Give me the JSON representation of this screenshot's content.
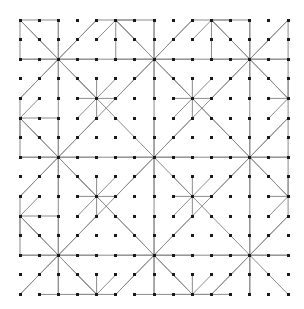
{
  "figure": {
    "type": "diagram",
    "background_color": "#ffffff",
    "canvas": {
      "width": 304,
      "height": 309
    }
  },
  "lattice": {
    "name": "square-dot-lattice",
    "origin_x": 20,
    "origin_y": 20,
    "spacing_x": 19.15,
    "spacing_y": 19.6,
    "cols": 15,
    "rows": 15,
    "dot_color": "#1a1a1a",
    "dot_size": 3
  },
  "edges": {
    "color": "#8c8c8c",
    "width": 1
  },
  "stars": {
    "spoke_directions": [
      [
        1,
        0
      ],
      [
        1,
        1
      ],
      [
        0,
        1
      ],
      [
        -1,
        1
      ],
      [
        -1,
        0
      ],
      [
        -1,
        -1
      ],
      [
        0,
        -1
      ],
      [
        1,
        -1
      ]
    ],
    "hubs": [
      {
        "col": 2,
        "row": 2,
        "arms": [
          2,
          2,
          2,
          2,
          2,
          2,
          2,
          2
        ]
      },
      {
        "col": 7,
        "row": 2,
        "arms": [
          2,
          2,
          2,
          2,
          2,
          2,
          2,
          2
        ]
      },
      {
        "col": 12,
        "row": 2,
        "arms": [
          2,
          2,
          2,
          2,
          2,
          2,
          2,
          2
        ]
      },
      {
        "col": 2,
        "row": 7,
        "arms": [
          2,
          2,
          2,
          2,
          2,
          2,
          2,
          2
        ]
      },
      {
        "col": 7,
        "row": 7,
        "arms": [
          2,
          2,
          2,
          2,
          2,
          2,
          2,
          2
        ]
      },
      {
        "col": 12,
        "row": 7,
        "arms": [
          2,
          2,
          2,
          2,
          2,
          2,
          2,
          2
        ]
      },
      {
        "col": 2,
        "row": 12,
        "arms": [
          2,
          2,
          2,
          2,
          2,
          2,
          2,
          2
        ]
      },
      {
        "col": 7,
        "row": 12,
        "arms": [
          2,
          2,
          2,
          2,
          2,
          2,
          2,
          2
        ]
      },
      {
        "col": 12,
        "row": 12,
        "arms": [
          2,
          2,
          2,
          2,
          2,
          2,
          2,
          2
        ]
      },
      {
        "col": 4,
        "row": 4,
        "arms": [
          1,
          1,
          1,
          1,
          1,
          1,
          1,
          1
        ]
      },
      {
        "col": 9,
        "row": 4,
        "arms": [
          1,
          1,
          1,
          1,
          1,
          1,
          1,
          1
        ]
      },
      {
        "col": 4,
        "row": 9,
        "arms": [
          1,
          1,
          1,
          1,
          1,
          1,
          1,
          1
        ]
      },
      {
        "col": 9,
        "row": 9,
        "arms": [
          1,
          1,
          1,
          1,
          1,
          1,
          1,
          1
        ]
      },
      {
        "col": 14,
        "row": 9,
        "arms": [
          1,
          1,
          1,
          1,
          1,
          1,
          1,
          1
        ]
      },
      {
        "col": 4,
        "row": 14,
        "arms": [
          1,
          1,
          1,
          1,
          1,
          1,
          1,
          1
        ]
      },
      {
        "col": 9,
        "row": 14,
        "arms": [
          1,
          1,
          1,
          1,
          1,
          1,
          1,
          1
        ]
      },
      {
        "col": 14,
        "row": 4,
        "arms": [
          1,
          1,
          1,
          1,
          1,
          1,
          1,
          1
        ]
      },
      {
        "col": 0,
        "row": 5,
        "arms": [
          2,
          1,
          1,
          0,
          0,
          0,
          1,
          1
        ]
      },
      {
        "col": 0,
        "row": 10,
        "arms": [
          2,
          1,
          1,
          0,
          0,
          0,
          1,
          1
        ]
      },
      {
        "col": 5,
        "row": 0,
        "arms": [
          1,
          1,
          2,
          1,
          1,
          0,
          0,
          0
        ]
      },
      {
        "col": 10,
        "row": 0,
        "arms": [
          1,
          1,
          2,
          1,
          1,
          0,
          0,
          0
        ]
      }
    ]
  },
  "diagonals": {
    "color": "#8c8c8c",
    "lines": [
      {
        "c1": 0,
        "r1": 4,
        "c2": 4,
        "r2": 0
      },
      {
        "c1": 0,
        "r1": 9,
        "c2": 9,
        "r2": 0
      },
      {
        "c1": 0,
        "r1": 14,
        "c2": 14,
        "r2": 0
      },
      {
        "c1": 5,
        "r1": 14,
        "c2": 14,
        "r2": 5
      },
      {
        "c1": 10,
        "r1": 14,
        "c2": 14,
        "r2": 10
      },
      {
        "c1": 0,
        "r1": 0,
        "c2": 4,
        "r2": 4
      },
      {
        "c1": 0,
        "r1": 5,
        "c2": 9,
        "r2": 14
      },
      {
        "c1": 5,
        "r1": 0,
        "c2": 14,
        "r2": 9
      },
      {
        "c1": 10,
        "r1": 0,
        "c2": 14,
        "r2": 4
      },
      {
        "c1": 0,
        "r1": 10,
        "c2": 4,
        "r2": 14
      }
    ]
  },
  "straight_runs": {
    "color": "#8c8c8c",
    "horizontal": [
      {
        "row": 0,
        "c1": 0,
        "c2": 2
      },
      {
        "row": 0,
        "c1": 5,
        "c2": 7
      },
      {
        "row": 0,
        "c1": 10,
        "c2": 12
      },
      {
        "row": 2,
        "c1": 0,
        "c2": 14
      },
      {
        "row": 7,
        "c1": 0,
        "c2": 14
      },
      {
        "row": 12,
        "c1": 0,
        "c2": 14
      },
      {
        "row": 14,
        "c1": 1,
        "c2": 4
      },
      {
        "row": 14,
        "c1": 6,
        "c2": 11
      }
    ],
    "vertical": [
      {
        "col": 0,
        "r1": 0,
        "r2": 2
      },
      {
        "col": 0,
        "r1": 5,
        "r2": 7
      },
      {
        "col": 0,
        "r1": 10,
        "r2": 12
      },
      {
        "col": 2,
        "r1": 0,
        "r2": 14
      },
      {
        "col": 7,
        "r1": 0,
        "r2": 14
      },
      {
        "col": 12,
        "r1": 0,
        "r2": 14
      },
      {
        "col": 14,
        "r1": 0,
        "r2": 4
      },
      {
        "col": 14,
        "r1": 5,
        "r2": 9
      }
    ]
  }
}
